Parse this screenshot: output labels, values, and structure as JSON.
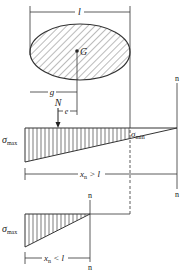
{
  "diagram": {
    "type": "eccentric-load stress distribution",
    "section": {
      "shape": "ellipse (hatched)",
      "width_label": "l",
      "centroid_label": "G"
    },
    "dimensions": {
      "width": "l",
      "centroid_distance": "g",
      "eccentricity": "e"
    },
    "load": {
      "label": "N"
    },
    "case_1": {
      "sigma_max": "σ",
      "sigma_max_sub": "max",
      "sigma_min": "σ",
      "sigma_min_sub": "min",
      "neutral_axis_label_top": "n",
      "neutral_axis_label_bottom": "n",
      "condition_x": "x",
      "condition_sub": "n",
      "condition_rel": " > l"
    },
    "case_2": {
      "sigma_max": "σ",
      "sigma_max_sub": "max",
      "neutral_axis_label_top": "n",
      "neutral_axis_label_bottom": "n",
      "condition_x": "x",
      "condition_sub": "n",
      "condition_rel": " < l"
    }
  },
  "colors": {
    "line": "#333333",
    "hatch": "#555555",
    "background": "#ffffff"
  }
}
